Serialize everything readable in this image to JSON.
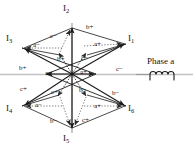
{
  "figure": {
    "type": "vector-star-diagram",
    "background_color": "#ffffff",
    "line_color": "#1a1a1a",
    "dotted_color": "#7a7a7a",
    "axis_color": "#b8b8b8"
  },
  "center": {
    "x": 72,
    "y": 74,
    "label": ""
  },
  "vectors": [
    {
      "id": "I1",
      "label": "I",
      "subscript": "1",
      "angle_deg": 30,
      "tip": {
        "x": 127,
        "y": 42
      },
      "label_pos": {
        "x": 131,
        "y": 38
      }
    },
    {
      "id": "I2",
      "label": "I",
      "subscript": "2",
      "angle_deg": 90,
      "tip": {
        "x": 72,
        "y": 25
      },
      "label_pos": {
        "x": 67,
        "y": 6
      }
    },
    {
      "id": "I3",
      "label": "I",
      "subscript": "3",
      "angle_deg": 150,
      "tip": {
        "x": 22,
        "y": 47
      },
      "label_pos": {
        "x": 10,
        "y": 38
      }
    },
    {
      "id": "I4",
      "label": "I",
      "subscript": "4",
      "angle_deg": 210,
      "tip": {
        "x": 22,
        "y": 108
      },
      "label_pos": {
        "x": 10,
        "y": 108
      }
    },
    {
      "id": "I5",
      "label": "I",
      "subscript": "5",
      "angle_deg": 270,
      "tip": {
        "x": 72,
        "y": 132
      },
      "label_pos": {
        "x": 67,
        "y": 137
      }
    },
    {
      "id": "I6",
      "label": "I",
      "subscript": "6",
      "angle_deg": 330,
      "tip": {
        "x": 127,
        "y": 108
      },
      "label_pos": {
        "x": 131,
        "y": 108
      }
    }
  ],
  "phase_labels": [
    {
      "text": "b+",
      "x": 88,
      "y": 27,
      "name": "phase-label-b-plus-top"
    },
    {
      "text": "c−",
      "x": 52,
      "y": 36,
      "name": "phase-label-c-minus-upper-left"
    },
    {
      "text": "a−",
      "x": 35,
      "y": 45,
      "name": "phase-label-a-minus-upper-left"
    },
    {
      "text": "a+",
      "x": 96,
      "y": 44,
      "name": "phase-label-a-plus-upper-right"
    },
    {
      "text": "b+",
      "x": 59,
      "y": 59,
      "name": "phase-label-b-plus-inner-top"
    },
    {
      "text": "c−",
      "x": 83,
      "y": 58,
      "name": "phase-label-c-minus-inner-top"
    },
    {
      "text": "b+",
      "x": 21,
      "y": 68,
      "name": "phase-label-b-plus-left"
    },
    {
      "text": "c−",
      "x": 118,
      "y": 69,
      "name": "phase-label-c-minus-right"
    },
    {
      "text": "a−",
      "x": 47,
      "y": 74,
      "name": "phase-label-a-minus-center-left"
    },
    {
      "text": "a+",
      "x": 82,
      "y": 73,
      "name": "phase-label-a-plus-center-right"
    },
    {
      "text": "c+",
      "x": 22,
      "y": 89,
      "name": "phase-label-c-plus-left"
    },
    {
      "text": "b−",
      "x": 81,
      "y": 90,
      "name": "phase-label-b-minus-inner-bottom"
    },
    {
      "text": "c+",
      "x": 53,
      "y": 92,
      "name": "phase-label-c-plus-inner-bottom"
    },
    {
      "text": "b−",
      "x": 114,
      "y": 93,
      "name": "phase-label-b-minus-right"
    },
    {
      "text": "a−",
      "x": 37,
      "y": 105,
      "name": "phase-label-a-minus-lower-left"
    },
    {
      "text": "a+",
      "x": 96,
      "y": 106,
      "name": "phase-label-a-plus-lower-right"
    },
    {
      "text": "b−",
      "x": 52,
      "y": 121,
      "name": "phase-label-b-minus-bottom"
    },
    {
      "text": "c+",
      "x": 84,
      "y": 120,
      "name": "phase-label-c-plus-bottom"
    }
  ],
  "legend": {
    "title": "Phase a",
    "title_pos": {
      "x": 148,
      "y": 62
    },
    "symbol": "inductor-coil",
    "symbol_pos": {
      "x": 148,
      "y": 74
    }
  }
}
